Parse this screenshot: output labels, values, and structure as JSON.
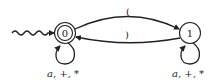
{
  "diagram": {
    "type": "finite-automaton",
    "states": [
      {
        "id": "0",
        "label": "0",
        "accepting": true,
        "initial": true
      },
      {
        "id": "1",
        "label": "1",
        "accepting": false,
        "initial": false
      }
    ],
    "transitions": [
      {
        "from": "0",
        "to": "1",
        "label": "("
      },
      {
        "from": "1",
        "to": "0",
        "label": ")"
      },
      {
        "from": "0",
        "to": "0",
        "label": "a, +, *"
      },
      {
        "from": "1",
        "to": "1",
        "label": "a, +, *"
      }
    ]
  }
}
